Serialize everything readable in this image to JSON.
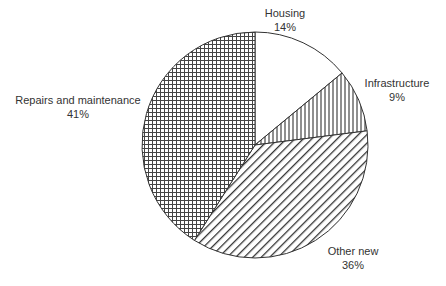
{
  "chart_data": {
    "type": "pie",
    "title": "",
    "start": "top",
    "direction": "clockwise",
    "slices": [
      {
        "label": "Housing",
        "value": 14,
        "value_label": "14%",
        "pattern": "none"
      },
      {
        "label": "Infrastructure",
        "value": 9,
        "value_label": "9%",
        "pattern": "vertical-lines"
      },
      {
        "label": "Other new",
        "value": 36,
        "value_label": "36%",
        "pattern": "diagonal-lines"
      },
      {
        "label": "Repairs and maintenance",
        "value": 41,
        "value_label": "41%",
        "pattern": "crosshatch"
      }
    ],
    "colors": {
      "stroke": "#333333",
      "fill": "#ffffff",
      "pattern": "#333333",
      "text": "#333333"
    },
    "legend": "none"
  }
}
